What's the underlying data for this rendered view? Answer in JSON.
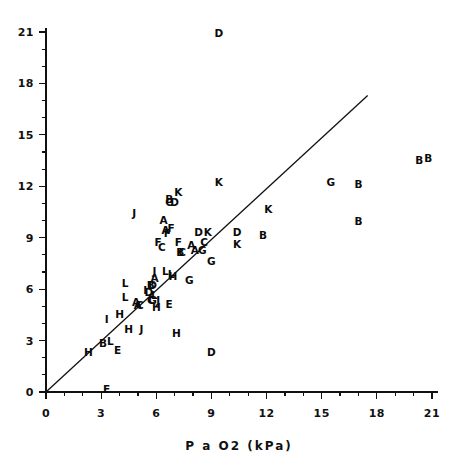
{
  "chart_data": {
    "type": "scatter",
    "title": "",
    "subtitle": "",
    "xlabel": "P a O2 (kPa)",
    "ylabel": "",
    "xlim": [
      0,
      21
    ],
    "ylim": [
      0,
      21
    ],
    "xticks": [
      0,
      3,
      6,
      9,
      12,
      15,
      18,
      21
    ],
    "yticks": [
      0,
      3,
      6,
      9,
      12,
      15,
      18,
      21
    ],
    "xtick_labels": [
      "0",
      "3",
      "6",
      "9",
      "12",
      "15",
      "18",
      "21"
    ],
    "ytick_labels": [
      "0",
      "3",
      "6",
      "9",
      "12",
      "15",
      "18",
      "21"
    ],
    "minor_tick_interval": 1,
    "grid": false,
    "legend": "none",
    "marker_style": "letter-coded",
    "reference_line": {
      "type": "identity",
      "label": "line of identity",
      "x0": 0,
      "y0": 0,
      "x1": 17.5,
      "y1": 17.3
    },
    "series": [
      {
        "name": "measurements",
        "marker": "letter",
        "points": [
          {
            "label": "D",
            "x": 9.4,
            "y": 20.9
          },
          {
            "label": "B",
            "x": 20.3,
            "y": 13.5
          },
          {
            "label": "B",
            "x": 20.8,
            "y": 13.6
          },
          {
            "label": "G",
            "x": 15.5,
            "y": 12.2
          },
          {
            "label": "B",
            "x": 17.0,
            "y": 12.1
          },
          {
            "label": "K",
            "x": 9.4,
            "y": 12.2
          },
          {
            "label": "K",
            "x": 7.2,
            "y": 11.6
          },
          {
            "label": "B",
            "x": 6.7,
            "y": 11.2
          },
          {
            "label": "C",
            "x": 6.7,
            "y": 11.0
          },
          {
            "label": "D",
            "x": 7.0,
            "y": 11.0
          },
          {
            "label": "K",
            "x": 12.1,
            "y": 10.6
          },
          {
            "label": "J",
            "x": 4.8,
            "y": 10.4
          },
          {
            "label": "B",
            "x": 17.0,
            "y": 9.9
          },
          {
            "label": "A",
            "x": 6.4,
            "y": 10.0
          },
          {
            "label": "A",
            "x": 6.5,
            "y": 9.4
          },
          {
            "label": "F",
            "x": 6.8,
            "y": 9.5
          },
          {
            "label": "F",
            "x": 6.6,
            "y": 9.2
          },
          {
            "label": "D",
            "x": 8.3,
            "y": 9.3
          },
          {
            "label": "K",
            "x": 8.8,
            "y": 9.3
          },
          {
            "label": "D",
            "x": 10.4,
            "y": 9.3
          },
          {
            "label": "B",
            "x": 11.8,
            "y": 9.1
          },
          {
            "label": "F",
            "x": 6.1,
            "y": 8.7
          },
          {
            "label": "C",
            "x": 6.3,
            "y": 8.4
          },
          {
            "label": "F",
            "x": 7.2,
            "y": 8.7
          },
          {
            "label": "C",
            "x": 8.6,
            "y": 8.7
          },
          {
            "label": "K",
            "x": 10.4,
            "y": 8.6
          },
          {
            "label": "A",
            "x": 7.9,
            "y": 8.5
          },
          {
            "label": "A",
            "x": 8.1,
            "y": 8.2
          },
          {
            "label": "G",
            "x": 8.5,
            "y": 8.2
          },
          {
            "label": "B",
            "x": 7.3,
            "y": 8.1
          },
          {
            "label": "C",
            "x": 7.4,
            "y": 8.1
          },
          {
            "label": "G",
            "x": 9.0,
            "y": 7.6
          },
          {
            "label": "J",
            "x": 5.9,
            "y": 7.0
          },
          {
            "label": "L",
            "x": 6.5,
            "y": 7.0
          },
          {
            "label": "L",
            "x": 6.8,
            "y": 6.8
          },
          {
            "label": "H",
            "x": 6.9,
            "y": 6.7
          },
          {
            "label": "A",
            "x": 5.9,
            "y": 6.6
          },
          {
            "label": "G",
            "x": 7.8,
            "y": 6.5
          },
          {
            "label": "L",
            "x": 4.3,
            "y": 6.3
          },
          {
            "label": "B",
            "x": 5.7,
            "y": 6.2
          },
          {
            "label": "D",
            "x": 5.8,
            "y": 6.2
          },
          {
            "label": "I",
            "x": 5.4,
            "y": 5.9
          },
          {
            "label": "D",
            "x": 5.6,
            "y": 5.8
          },
          {
            "label": "L",
            "x": 4.3,
            "y": 5.5
          },
          {
            "label": "L",
            "x": 5.9,
            "y": 5.6
          },
          {
            "label": "C",
            "x": 5.7,
            "y": 5.3
          },
          {
            "label": "G",
            "x": 5.8,
            "y": 5.3
          },
          {
            "label": "J",
            "x": 6.1,
            "y": 5.3
          },
          {
            "label": "A",
            "x": 4.9,
            "y": 5.2
          },
          {
            "label": "A",
            "x": 5.0,
            "y": 5.0
          },
          {
            "label": "C",
            "x": 5.1,
            "y": 5.0
          },
          {
            "label": "E",
            "x": 6.7,
            "y": 5.1
          },
          {
            "label": "H",
            "x": 6.0,
            "y": 4.9
          },
          {
            "label": "H",
            "x": 4.0,
            "y": 4.5
          },
          {
            "label": "I",
            "x": 3.3,
            "y": 4.2
          },
          {
            "label": "H",
            "x": 4.5,
            "y": 3.6
          },
          {
            "label": "J",
            "x": 5.2,
            "y": 3.6
          },
          {
            "label": "H",
            "x": 7.1,
            "y": 3.4
          },
          {
            "label": "B",
            "x": 3.1,
            "y": 2.8
          },
          {
            "label": "L",
            "x": 3.5,
            "y": 2.9
          },
          {
            "label": "H",
            "x": 2.3,
            "y": 2.3
          },
          {
            "label": "E",
            "x": 3.9,
            "y": 2.4
          },
          {
            "label": "D",
            "x": 9.0,
            "y": 2.3
          },
          {
            "label": "E",
            "x": 3.3,
            "y": 0.1
          }
        ]
      }
    ]
  },
  "axes": {
    "x_axis_name": "x-axis",
    "y_axis_name": "y-axis"
  }
}
